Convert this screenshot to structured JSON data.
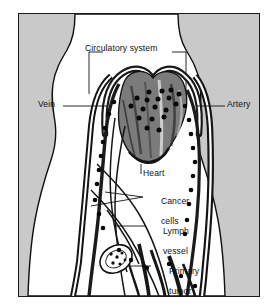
{
  "figure": {
    "type": "anatomical-diagram",
    "view": "anterior human torso silhouette"
  },
  "colors": {
    "background_gray": "#c9c9c9",
    "body_white": "#ffffff",
    "ink": "#111111",
    "frame_border": "#1a1a1a",
    "vessel_dark": "#1d1d1d",
    "heart_shade": "#5a5a5a"
  },
  "labels": {
    "circulatory_system": "Circulatory system",
    "vein": "Vein",
    "artery": "Artery",
    "heart": "Heart",
    "cancer_cells_line1": "Cancer",
    "cancer_cells_line2": "cells",
    "lymph_vessel_line1": "Lymph",
    "lymph_vessel_line2": "vessel",
    "primary_tumor_line1": "Primary",
    "primary_tumor_line2": "tumor"
  },
  "anatomy": {
    "parts": [
      "circulatory system",
      "vein",
      "artery",
      "heart",
      "cancer cells",
      "lymph vessel",
      "primary tumor"
    ]
  },
  "cancer_cell_dots": {
    "heart_cluster": [
      [
        130,
        78
      ],
      [
        143,
        77
      ],
      [
        152,
        76
      ],
      [
        118,
        84
      ],
      [
        128,
        86
      ],
      [
        139,
        85
      ],
      [
        150,
        84
      ],
      [
        160,
        80
      ],
      [
        112,
        92
      ],
      [
        124,
        95
      ],
      [
        136,
        93
      ],
      [
        147,
        96
      ],
      [
        157,
        90
      ],
      [
        120,
        104
      ],
      [
        133,
        105
      ],
      [
        145,
        103
      ],
      [
        128,
        114
      ],
      [
        140,
        116
      ]
    ],
    "left_vein": [
      [
        95,
        88
      ],
      [
        90,
        100
      ],
      [
        86,
        114
      ],
      [
        84,
        128
      ],
      [
        82,
        142
      ],
      [
        80,
        156
      ],
      [
        78,
        170
      ],
      [
        76,
        186
      ],
      [
        80,
        200
      ],
      [
        84,
        214
      ]
    ],
    "right_artery": [
      [
        166,
        92
      ],
      [
        170,
        106
      ],
      [
        172,
        120
      ],
      [
        174,
        134
      ],
      [
        176,
        148
      ],
      [
        174,
        162
      ],
      [
        172,
        176
      ],
      [
        170,
        190
      ],
      [
        168,
        206
      ],
      [
        166,
        220
      ]
    ],
    "lower_branches": [
      [
        100,
        236
      ],
      [
        112,
        246
      ],
      [
        128,
        254
      ],
      [
        150,
        250
      ],
      [
        162,
        262
      ],
      [
        176,
        272
      ]
    ],
    "tumor_cluster": [
      [
        92,
        240
      ],
      [
        97,
        244
      ],
      [
        101,
        238
      ],
      [
        95,
        249
      ],
      [
        103,
        247
      ],
      [
        99,
        253
      ]
    ]
  }
}
